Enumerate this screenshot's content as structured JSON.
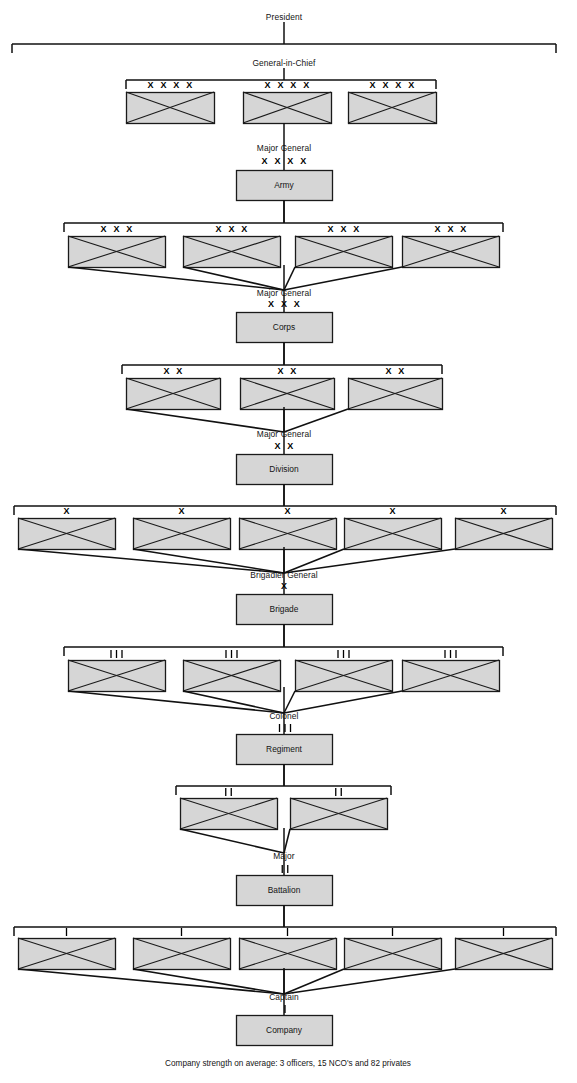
{
  "chart": {
    "caption": "Company strength on average: 3 officers, 15 NCO's and 82 privates",
    "colors": {
      "unit_fill": "#d6d6d6",
      "unit_stroke": "#1a1a1a",
      "line": "#111111",
      "background": "#ffffff",
      "text": "#141414"
    },
    "echelon_symbols": {
      "army": "X X X X",
      "corps": "X X X",
      "division": "X X",
      "brigade": "X",
      "regiment": "bars-3",
      "battalion": "bars-2",
      "company": "bars-1"
    },
    "levels": [
      {
        "id": "president",
        "rank_label": "President",
        "unit_label": "",
        "subordinate_count": 0,
        "symbol": ""
      },
      {
        "id": "general-in-chief",
        "rank_label": "General-in-Chief",
        "unit_label": "",
        "subordinate_count": 3,
        "symbol": "X X X X"
      },
      {
        "id": "army",
        "rank_label": "Major General",
        "unit_label": "Army",
        "subordinate_count": 4,
        "symbol": "X X X X"
      },
      {
        "id": "corps",
        "rank_label": "Major General",
        "unit_label": "Corps",
        "subordinate_count": 3,
        "symbol": "X X X"
      },
      {
        "id": "division",
        "rank_label": "Major General",
        "unit_label": "Division",
        "subordinate_count": 5,
        "symbol": "X X"
      },
      {
        "id": "brigade",
        "rank_label": "Brigadier General",
        "unit_label": "Brigade",
        "subordinate_count": 4,
        "symbol": "X"
      },
      {
        "id": "regiment",
        "rank_label": "Colonel",
        "unit_label": "Regiment",
        "subordinate_count": 2,
        "symbol": "bars-3"
      },
      {
        "id": "battalion",
        "rank_label": "Major",
        "unit_label": "Battalion",
        "subordinate_count": 5,
        "symbol": "bars-2"
      },
      {
        "id": "company",
        "rank_label": "Captain",
        "unit_label": "Company",
        "subordinate_count": 0,
        "symbol": "bars-1"
      }
    ],
    "rank_labels": {
      "president": "President",
      "general_in_chief": "General-in-Chief",
      "major_general_army": "Major General",
      "major_general_corps": "Major General",
      "major_general_division": "Major General",
      "brigadier_general": "Brigadier General",
      "colonel": "Colonel",
      "major": "Major",
      "captain": "Captain"
    },
    "unit_labels": {
      "army": "Army",
      "corps": "Corps",
      "division": "Division",
      "brigade": "Brigade",
      "regiment": "Regiment",
      "battalion": "Battalion",
      "company": "Company"
    },
    "echelon_text": {
      "four_x": "X X X X",
      "three_x": "X X X",
      "two_x": "X X",
      "one_x": "X"
    },
    "subordinate_rows": [
      {
        "parent": "general-in-chief",
        "symbol": "X X X X",
        "boxes": [
          {
            "x": 126,
            "y": 92,
            "w": 88,
            "h": 31
          },
          {
            "x": 243,
            "y": 92,
            "w": 88,
            "h": 31
          },
          {
            "x": 348,
            "y": 92,
            "w": 88,
            "h": 31
          }
        ]
      },
      {
        "parent": "army",
        "symbol": "X X X",
        "boxes": [
          {
            "x": 68,
            "y": 236,
            "w": 97,
            "h": 31
          },
          {
            "x": 183,
            "y": 236,
            "w": 97,
            "h": 31
          },
          {
            "x": 295,
            "y": 236,
            "w": 97,
            "h": 31
          },
          {
            "x": 402,
            "y": 236,
            "w": 97,
            "h": 31
          }
        ]
      },
      {
        "parent": "corps",
        "symbol": "X X",
        "boxes": [
          {
            "x": 126,
            "y": 378,
            "w": 94,
            "h": 31
          },
          {
            "x": 240,
            "y": 378,
            "w": 94,
            "h": 31
          },
          {
            "x": 348,
            "y": 378,
            "w": 94,
            "h": 31
          }
        ]
      },
      {
        "parent": "division",
        "symbol": "X",
        "boxes": [
          {
            "x": 18,
            "y": 518,
            "w": 97,
            "h": 31
          },
          {
            "x": 133,
            "y": 518,
            "w": 97,
            "h": 31
          },
          {
            "x": 239,
            "y": 518,
            "w": 97,
            "h": 31
          },
          {
            "x": 344,
            "y": 518,
            "w": 97,
            "h": 31
          },
          {
            "x": 455,
            "y": 518,
            "w": 97,
            "h": 31
          }
        ]
      },
      {
        "parent": "brigade",
        "symbol": "bars-3",
        "boxes": [
          {
            "x": 68,
            "y": 660,
            "w": 97,
            "h": 31
          },
          {
            "x": 183,
            "y": 660,
            "w": 97,
            "h": 31
          },
          {
            "x": 295,
            "y": 660,
            "w": 97,
            "h": 31
          },
          {
            "x": 402,
            "y": 660,
            "w": 97,
            "h": 31
          }
        ]
      },
      {
        "parent": "regiment",
        "symbol": "bars-2",
        "boxes": [
          {
            "x": 180,
            "y": 798,
            "w": 97,
            "h": 31
          },
          {
            "x": 290,
            "y": 798,
            "w": 97,
            "h": 31
          }
        ]
      },
      {
        "parent": "battalion",
        "symbol": "bars-1",
        "boxes": [
          {
            "x": 18,
            "y": 938,
            "w": 97,
            "h": 31
          },
          {
            "x": 133,
            "y": 938,
            "w": 97,
            "h": 31
          },
          {
            "x": 239,
            "y": 938,
            "w": 97,
            "h": 31
          },
          {
            "x": 344,
            "y": 938,
            "w": 97,
            "h": 31
          },
          {
            "x": 455,
            "y": 938,
            "w": 97,
            "h": 31
          }
        ]
      }
    ],
    "named_boxes": [
      {
        "id": "army",
        "x": 236,
        "y": 170,
        "w": 96,
        "h": 30
      },
      {
        "id": "corps",
        "x": 236,
        "y": 312,
        "w": 96,
        "h": 30
      },
      {
        "id": "division",
        "x": 236,
        "y": 454,
        "w": 96,
        "h": 30
      },
      {
        "id": "brigade",
        "x": 236,
        "y": 594,
        "w": 96,
        "h": 30
      },
      {
        "id": "regiment",
        "x": 236,
        "y": 734,
        "w": 96,
        "h": 30
      },
      {
        "id": "battalion",
        "x": 236,
        "y": 875,
        "w": 96,
        "h": 30
      },
      {
        "id": "company",
        "x": 236,
        "y": 1015,
        "w": 96,
        "h": 30
      }
    ]
  }
}
